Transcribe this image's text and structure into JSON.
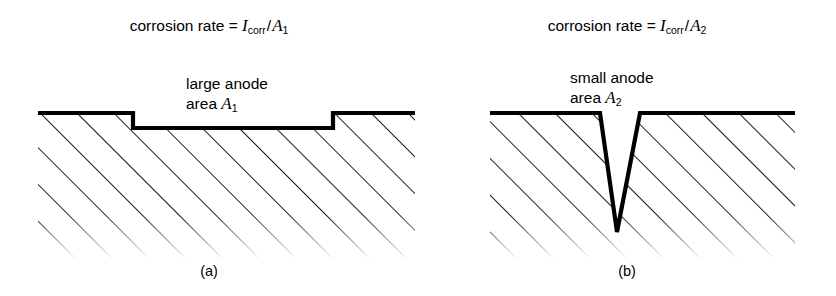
{
  "figure": {
    "background_color": "#ffffff",
    "ink_color": "#000000",
    "panels": [
      {
        "id": "a",
        "sublabel": "(a)",
        "formula": {
          "prefix": "corrosion rate = ",
          "current_symbol": "I",
          "current_subscript": "corr",
          "divider": "/",
          "area_symbol": "A",
          "area_subscript": "1",
          "full_text": "corrosion rate = Icorr/A1"
        },
        "anode_label": {
          "line1": "large anode",
          "line2_prefix": "area ",
          "line2_symbol": "A",
          "line2_subscript": "1",
          "full_text": "large anode area A1"
        },
        "geometry": {
          "description": "wide shallow rectangular trench in hatched metal",
          "surface_y": 113,
          "trench_floor_y": 128,
          "trench_left_x": 133,
          "trench_right_x": 333,
          "block_left_x": 38,
          "block_right_x": 415,
          "hatch_fade_y": 250
        }
      },
      {
        "id": "b",
        "sublabel": "(b)",
        "formula": {
          "prefix": "corrosion rate = ",
          "current_symbol": "I",
          "current_subscript": "corr",
          "divider": "/",
          "area_symbol": "A",
          "area_subscript": "2",
          "full_text": "corrosion rate = Icorr/A2"
        },
        "anode_label": {
          "line1": "small anode",
          "line2_prefix": "area ",
          "line2_symbol": "A",
          "line2_subscript": "2",
          "full_text": "small anode area A2"
        },
        "geometry": {
          "description": "narrow deep V-shaped pit in hatched metal",
          "surface_y": 113,
          "notch_top_left_x": 600,
          "notch_top_right_x": 640,
          "notch_apex_x": 617,
          "notch_apex_y": 232,
          "block_left_x": 490,
          "block_right_x": 795,
          "hatch_fade_y": 250
        }
      }
    ]
  }
}
